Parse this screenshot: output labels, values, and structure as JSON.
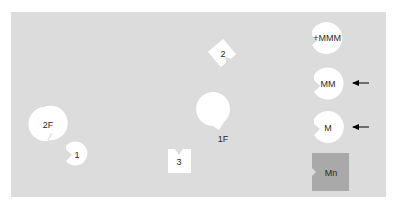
{
  "diagram": {
    "background_color": "#dcdcdc",
    "piece_color": "#ffffff",
    "highlight_color": "#a9a9a9",
    "pieces": [
      {
        "id": "2F",
        "label": "2F",
        "shape": "circle-notched"
      },
      {
        "id": "1",
        "label": "1",
        "shape": "circle-notched"
      },
      {
        "id": "2",
        "label": "2",
        "shape": "square-notched-rotated"
      },
      {
        "id": "3",
        "label": "3",
        "shape": "square-notched"
      },
      {
        "id": "1F",
        "label": "1F",
        "shape": "circle-notched"
      },
      {
        "id": "+MMM",
        "label": "+MMM",
        "shape": "circle-notched"
      },
      {
        "id": "MM",
        "label": "MM",
        "shape": "circle-notched",
        "arrow": true
      },
      {
        "id": "M",
        "label": "M",
        "shape": "circle-notched",
        "arrow": true
      },
      {
        "id": "Mn",
        "label": "Mn",
        "shape": "square-notched",
        "highlighted": true
      }
    ]
  }
}
